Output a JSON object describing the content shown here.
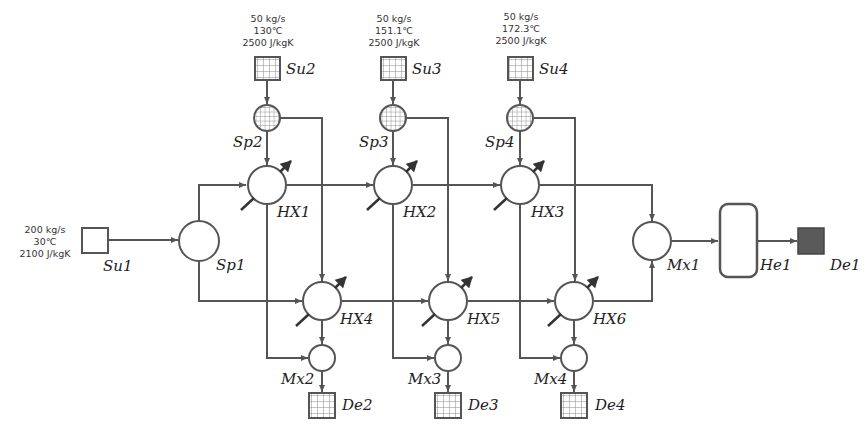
{
  "diagram": {
    "colors": {
      "line": "#555555",
      "dark_fill": "#555555",
      "hatch": "#888888",
      "background": "#ffffff"
    },
    "sources": [
      {
        "id": "Su1",
        "label": "Su1",
        "flow": "200 kg/s",
        "temperature": "30℃",
        "heat_capacity": "2100 J/kgK",
        "icon": "empty-square"
      },
      {
        "id": "Su2",
        "label": "Su2",
        "flow": "50 kg/s",
        "temperature": "130℃",
        "heat_capacity": "2500 J/kgK",
        "icon": "grid-square"
      },
      {
        "id": "Su3",
        "label": "Su3",
        "flow": "50 kg/s",
        "temperature": "151.1℃",
        "heat_capacity": "2500 J/kgK",
        "icon": "grid-square"
      },
      {
        "id": "Su4",
        "label": "Su4",
        "flow": "50 kg/s",
        "temperature": "172.3℃",
        "heat_capacity": "2500 J/kgK",
        "icon": "grid-square"
      }
    ],
    "splitters": [
      {
        "id": "Sp1",
        "label": "Sp1"
      },
      {
        "id": "Sp2",
        "label": "Sp2"
      },
      {
        "id": "Sp3",
        "label": "Sp3"
      },
      {
        "id": "Sp4",
        "label": "Sp4"
      }
    ],
    "heat_exchangers": [
      {
        "id": "HX1",
        "label": "HX1"
      },
      {
        "id": "HX2",
        "label": "HX2"
      },
      {
        "id": "HX3",
        "label": "HX3"
      },
      {
        "id": "HX4",
        "label": "HX4"
      },
      {
        "id": "HX5",
        "label": "HX5"
      },
      {
        "id": "HX6",
        "label": "HX6"
      }
    ],
    "mixers": [
      {
        "id": "Mx1",
        "label": "Mx1"
      },
      {
        "id": "Mx2",
        "label": "Mx2"
      },
      {
        "id": "Mx3",
        "label": "Mx3"
      },
      {
        "id": "Mx4",
        "label": "Mx4"
      }
    ],
    "heaters": [
      {
        "id": "He1",
        "label": "He1"
      }
    ],
    "demands": [
      {
        "id": "De1",
        "label": "De1",
        "icon": "filled-square"
      },
      {
        "id": "De2",
        "label": "De2",
        "icon": "grid-square"
      },
      {
        "id": "De3",
        "label": "De3",
        "icon": "grid-square"
      },
      {
        "id": "De4",
        "label": "De4",
        "icon": "grid-square"
      }
    ],
    "connections": [
      [
        "Su1",
        "Sp1"
      ],
      [
        "Sp1",
        "HX1"
      ],
      [
        "Sp1",
        "HX4"
      ],
      [
        "Su2",
        "Sp2"
      ],
      [
        "Sp2",
        "HX1"
      ],
      [
        "Sp2",
        "HX4"
      ],
      [
        "Su3",
        "Sp3"
      ],
      [
        "Sp3",
        "HX2"
      ],
      [
        "Sp3",
        "HX5"
      ],
      [
        "Su4",
        "Sp4"
      ],
      [
        "Sp4",
        "HX3"
      ],
      [
        "Sp4",
        "HX6"
      ],
      [
        "HX1",
        "HX2"
      ],
      [
        "HX2",
        "HX3"
      ],
      [
        "HX3",
        "Mx1"
      ],
      [
        "HX4",
        "HX5"
      ],
      [
        "HX5",
        "HX6"
      ],
      [
        "HX6",
        "Mx1"
      ],
      [
        "HX1",
        "Mx2"
      ],
      [
        "HX4",
        "Mx2"
      ],
      [
        "Mx2",
        "De2"
      ],
      [
        "HX2",
        "Mx3"
      ],
      [
        "HX5",
        "Mx3"
      ],
      [
        "Mx3",
        "De3"
      ],
      [
        "HX3",
        "Mx4"
      ],
      [
        "HX6",
        "Mx4"
      ],
      [
        "Mx4",
        "De4"
      ],
      [
        "Mx1",
        "He1"
      ],
      [
        "He1",
        "De1"
      ]
    ]
  }
}
